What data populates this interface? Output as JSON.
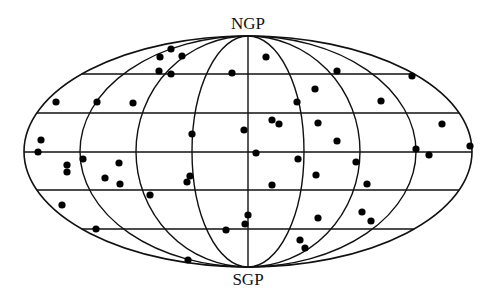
{
  "figure": {
    "projection": "Mollweide / Aitoff all-sky (galactic coordinates)",
    "labels": {
      "north_pole": "NGP",
      "south_pole": "SGP"
    },
    "colors": {
      "background": "#ffffff",
      "grid": "#111111",
      "points": "#000000"
    }
  },
  "geometry": {
    "cx": 248,
    "cy": 151.5,
    "rx": 224,
    "ry": 115.5,
    "meridian_count": 8,
    "parallels_y": [
      74,
      113,
      152,
      190,
      229
    ]
  },
  "points": [
    [
      160,
      57
    ],
    [
      171,
      49
    ],
    [
      182,
      56
    ],
    [
      159,
      71
    ],
    [
      171,
      74
    ],
    [
      232,
      73
    ],
    [
      266,
      57
    ],
    [
      337,
      71
    ],
    [
      412,
      76
    ],
    [
      56,
      102
    ],
    [
      97,
      102
    ],
    [
      133,
      103
    ],
    [
      315,
      89
    ],
    [
      297,
      102
    ],
    [
      381,
      101
    ],
    [
      41,
      140
    ],
    [
      192,
      134
    ],
    [
      244,
      130
    ],
    [
      272,
      120
    ],
    [
      279,
      124
    ],
    [
      318,
      123
    ],
    [
      442,
      124
    ],
    [
      337,
      141
    ],
    [
      38,
      152
    ],
    [
      256,
      153
    ],
    [
      416,
      149
    ],
    [
      429,
      155
    ],
    [
      470,
      146
    ],
    [
      67,
      165
    ],
    [
      67,
      172
    ],
    [
      83,
      159
    ],
    [
      119,
      163
    ],
    [
      105,
      178
    ],
    [
      120,
      184
    ],
    [
      190,
      176
    ],
    [
      187,
      182
    ],
    [
      298,
      159
    ],
    [
      356,
      162
    ],
    [
      316,
      175
    ],
    [
      272,
      185
    ],
    [
      367,
      184
    ],
    [
      150,
      195
    ],
    [
      62,
      205
    ],
    [
      96,
      229
    ],
    [
      248,
      215
    ],
    [
      245,
      224
    ],
    [
      226,
      230
    ],
    [
      318,
      218
    ],
    [
      362,
      212
    ],
    [
      371,
      221
    ],
    [
      300,
      240
    ],
    [
      305,
      248
    ],
    [
      188,
      260
    ]
  ]
}
